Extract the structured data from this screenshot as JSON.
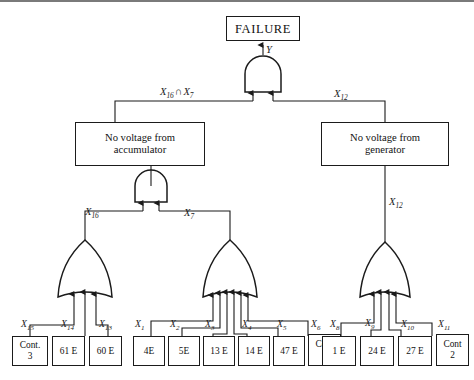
{
  "diagram": {
    "type": "fault-tree",
    "title_node": "FAILURE",
    "gates": [
      {
        "id": "g-top",
        "kind": "AND",
        "output_label": "Y",
        "inputs": 2
      },
      {
        "id": "g-accumulator",
        "kind": "AND",
        "output_label": "",
        "inputs": 2
      },
      {
        "id": "g-or-left",
        "kind": "OR",
        "output_label": "X16",
        "inputs": 3
      },
      {
        "id": "g-or-mid",
        "kind": "OR",
        "output_label": "X7",
        "inputs": 6
      },
      {
        "id": "g-or-right",
        "kind": "OR",
        "output_label": "X12",
        "inputs": 4
      }
    ],
    "intermediate_nodes": [
      {
        "id": "n-accumulator",
        "text": "No voltage from\naccumulator"
      },
      {
        "id": "n-generator",
        "text": "No voltage from\ngenerator"
      }
    ],
    "edge_labels": {
      "top_out": "Y",
      "and_left_branch": "X16 ∩ X7",
      "and_right_branch": "X12",
      "or_left_out": "X16",
      "or_mid_out": "X7",
      "or_right_out": "X12"
    },
    "leaf_groups": [
      {
        "group": "accumulator-left",
        "leaves": [
          {
            "var": "X15",
            "text": "Cont.\n3"
          },
          {
            "var": "X14",
            "text": "61 E"
          },
          {
            "var": "X13",
            "text": "60 E"
          }
        ]
      },
      {
        "group": "accumulator-right",
        "leaves": [
          {
            "var": "X1",
            "text": "4E"
          },
          {
            "var": "X2",
            "text": "5E"
          },
          {
            "var": "X3",
            "text": "13 E"
          },
          {
            "var": "X4",
            "text": "14 E"
          },
          {
            "var": "X5",
            "text": "47 E"
          },
          {
            "var": "X6",
            "text": "Cont\n1"
          }
        ]
      },
      {
        "group": "generator",
        "leaves": [
          {
            "var": "X8",
            "text": "1 E"
          },
          {
            "var": "X9",
            "text": "24 E"
          },
          {
            "var": "X10",
            "text": "27 E"
          },
          {
            "var": "X11",
            "text": "Cont\n2"
          }
        ]
      }
    ],
    "colors": {
      "line": "#1b1b1b",
      "box_border": "#1b1b1b",
      "background": "#ffffff",
      "rule": "#7a7a7a"
    }
  }
}
